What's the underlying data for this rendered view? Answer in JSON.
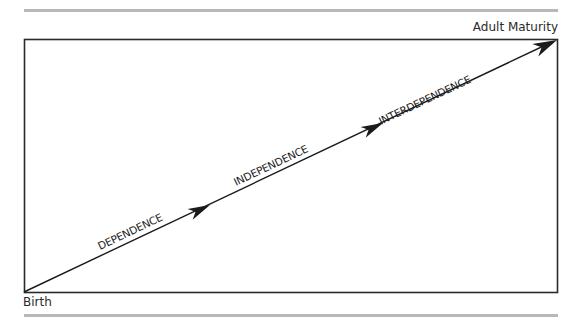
{
  "diagram": {
    "end_label": "Adult Maturity",
    "start_label": "Birth",
    "stages": [
      {
        "label": "DEPENDENCE"
      },
      {
        "label": "INDEPENDENCE"
      },
      {
        "label": "INTERDEPENDENCE"
      }
    ],
    "colors": {
      "rule": "#b8b8b8",
      "frame": "#2a2a2a",
      "arrow": "#1a1a1a",
      "text": "#2a2a2a"
    }
  }
}
